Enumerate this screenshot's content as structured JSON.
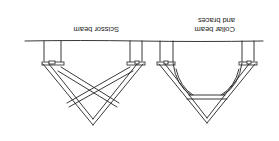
{
  "figure": {
    "orientation": "rotated-180",
    "labels": {
      "scissor": "Scissor beam",
      "collar_line1": "Collar beam",
      "collar_line2": "and braces"
    },
    "colors": {
      "ink": "#222222",
      "background": "#ffffff"
    }
  }
}
